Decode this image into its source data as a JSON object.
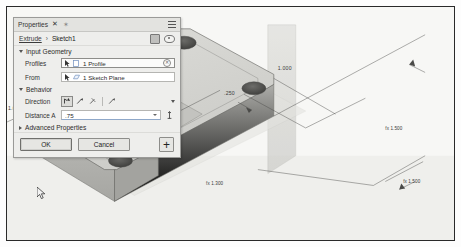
{
  "panel": {
    "titlebar": {
      "title": "Properties",
      "close_label": "✕",
      "pin_label": "✶",
      "menu_icon": "hamburger-menu-icon"
    },
    "breadcrumb": {
      "parent": "Extrude",
      "separator": "›",
      "current": "Sketch1",
      "icons": [
        "solid-body-icon",
        "visibility-eye-icon"
      ]
    },
    "sections": {
      "input_geometry": {
        "label": "Input Geometry",
        "expanded": true,
        "fields": [
          {
            "label": "Profiles",
            "icon": "select-arrow-icon",
            "type_icon": "profile-icon",
            "value": "1 Profile",
            "has_clear": true,
            "clear_label": "✕"
          },
          {
            "label": "From",
            "icon": "select-arrow-icon",
            "type_icon": "sketch-plane-icon",
            "value": "1 Sketch Plane",
            "has_clear": false,
            "clear_label": ""
          }
        ]
      },
      "behavior": {
        "label": "Behavior",
        "expanded": true,
        "direction": {
          "label": "Direction",
          "options": [
            "direction-default",
            "direction-flipped",
            "direction-symmetric",
            "direction-asymmetric"
          ],
          "selected_index": 0,
          "dropdown_icon": "chevron-down-icon"
        },
        "distance": {
          "label": "Distance A",
          "value": ".75",
          "dropdown_icon": "chevron-down-icon",
          "measure_icon": "measure-icon"
        }
      },
      "advanced_properties": {
        "label": "Advanced Properties",
        "expanded": false
      }
    },
    "footer": {
      "ok_label": "OK",
      "cancel_label": "Cancel",
      "apply_label": "+"
    }
  },
  "viewport": {
    "model_name": "extruded-plate",
    "dimensions": [
      {
        "name": "hole-offset-top",
        "text": ".250"
      },
      {
        "name": "hole-offset-right",
        "text": ".250"
      },
      {
        "name": "edge-length-right",
        "text": "1.000"
      },
      {
        "name": "extrude-depth",
        "text": ".75"
      },
      {
        "name": "corner-radius-left",
        "text": "1.000"
      },
      {
        "name": "hole-diameter-upper",
        "text": "fx 1.500"
      },
      {
        "name": "hole-diameter-lower",
        "text": "fx 1.500"
      },
      {
        "name": "hole-diameter-right",
        "text": "fx 1.300"
      }
    ],
    "colors": {
      "body_top": "#d6d6d2",
      "body_front": "#b4b4b0",
      "body_side": "#9e9e9a",
      "workplane": "#cfcfcb",
      "hole": "#4a4a48",
      "axis_arrow": "#2b2b2b",
      "background": "#f6f6f4"
    }
  }
}
